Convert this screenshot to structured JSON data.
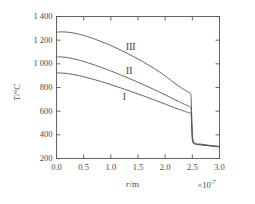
{
  "chart_data": {
    "type": "line",
    "title": "",
    "xlabel": "r/m",
    "ylabel": "T/°C",
    "x_multiplier": "×10",
    "x_multiplier_exp": "-7",
    "xlim": [
      0.0,
      3.0
    ],
    "ylim": [
      200,
      1400
    ],
    "xticks": [
      "0.0",
      "0.5",
      "1.0",
      "1.5",
      "2.0",
      "2.5",
      "3.0"
    ],
    "xtick_values": [
      0.0,
      0.5,
      1.0,
      1.5,
      2.0,
      2.5,
      3.0
    ],
    "yticks": [
      "200",
      "400",
      "600",
      "800",
      "1 000",
      "1 200",
      "1 400"
    ],
    "ytick_values": [
      200,
      400,
      600,
      800,
      1000,
      1200,
      1400
    ],
    "grid": false,
    "legend_position": "inline-annotations",
    "frame": "box-ticks-inward",
    "annotations": [
      {
        "label": "III",
        "x": 1.28,
        "y": 1130
      },
      {
        "label": "II",
        "x": 1.28,
        "y": 930
      },
      {
        "label": "I",
        "x": 1.22,
        "y": 710
      }
    ],
    "series": [
      {
        "name": "III",
        "color": "#555555",
        "x": [
          0.0,
          0.1,
          0.2,
          0.3,
          0.4,
          0.5,
          0.65,
          0.8,
          1.0,
          1.2,
          1.4,
          1.6,
          1.8,
          2.0,
          2.2,
          2.35,
          2.43,
          2.46,
          2.48,
          2.5,
          2.55,
          2.65,
          2.8,
          3.0
        ],
        "y": [
          1268,
          1270,
          1268,
          1262,
          1252,
          1240,
          1218,
          1192,
          1155,
          1112,
          1065,
          1015,
          960,
          898,
          828,
          782,
          760,
          752,
          700,
          400,
          330,
          322,
          312,
          302
        ]
      },
      {
        "name": "II",
        "color": "#555555",
        "x": [
          0.0,
          0.1,
          0.2,
          0.3,
          0.4,
          0.5,
          0.65,
          0.8,
          1.0,
          1.2,
          1.4,
          1.6,
          1.8,
          2.0,
          2.2,
          2.35,
          2.43,
          2.46,
          2.48,
          2.5,
          2.55,
          2.65,
          2.8,
          3.0
        ],
        "y": [
          1058,
          1058,
          1053,
          1044,
          1033,
          1020,
          998,
          974,
          940,
          903,
          864,
          824,
          782,
          738,
          692,
          660,
          643,
          636,
          600,
          370,
          326,
          318,
          310,
          300
        ]
      },
      {
        "name": "I",
        "color": "#555555",
        "x": [
          0.0,
          0.1,
          0.2,
          0.3,
          0.4,
          0.5,
          0.65,
          0.8,
          1.0,
          1.2,
          1.4,
          1.6,
          1.8,
          2.0,
          2.2,
          2.35,
          2.43,
          2.46,
          2.48,
          2.5,
          2.55,
          2.65,
          2.8,
          3.0
        ],
        "y": [
          923,
          922,
          918,
          911,
          902,
          891,
          873,
          853,
          824,
          794,
          762,
          729,
          695,
          660,
          624,
          600,
          588,
          583,
          560,
          355,
          322,
          315,
          307,
          298
        ]
      }
    ]
  }
}
